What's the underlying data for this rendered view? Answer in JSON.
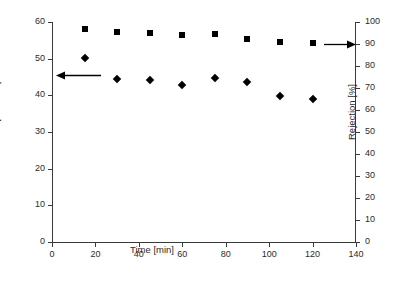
{
  "chart_data": {
    "type": "scatter",
    "title": "",
    "xlabel": "Time [min]",
    "ylabel": "Flux [L m-2 h-1]",
    "y2label": "Rejection [%]",
    "xlim": [
      0,
      140
    ],
    "ylim": [
      0,
      60
    ],
    "y2lim": [
      0,
      100
    ],
    "xticks": [
      0,
      20,
      40,
      60,
      80,
      100,
      120,
      140
    ],
    "yticks": [
      0,
      10,
      20,
      30,
      40,
      50,
      60
    ],
    "y2ticks": [
      0,
      10,
      20,
      30,
      40,
      50,
      60,
      70,
      80,
      90,
      100
    ],
    "grid": false,
    "legend": "none",
    "x": [
      15,
      30,
      45,
      60,
      75,
      90,
      105,
      120
    ],
    "series": [
      {
        "name": "Rejection",
        "marker": "square",
        "axis": "right",
        "color": "#000000",
        "values": [
          97.0,
          95.5,
          95.0,
          94.0,
          94.5,
          92.5,
          91.0,
          90.5
        ]
      },
      {
        "name": "Flux",
        "marker": "diamond",
        "axis": "left",
        "color": "#000000",
        "values": [
          50.3,
          44.5,
          44.1,
          42.7,
          44.6,
          43.7,
          39.8,
          38.9
        ]
      }
    ],
    "annotations": [
      {
        "name": "arrow-to-left-axis",
        "icon": "arrow-left-icon",
        "direction": "left"
      },
      {
        "name": "arrow-to-right-axis",
        "icon": "arrow-right-icon",
        "direction": "right"
      }
    ]
  },
  "axes": {
    "x": {
      "title": "Time [min]",
      "tick_labels": [
        "0",
        "20",
        "40",
        "60",
        "80",
        "100",
        "120",
        "140"
      ]
    },
    "y_left": {
      "title_prefix": "Flux [L m",
      "title_sup1": "-2",
      "title_mid": " h",
      "title_sup2": "-1",
      "title_suffix": "]",
      "tick_labels": [
        "0",
        "10",
        "20",
        "30",
        "40",
        "50",
        "60"
      ]
    },
    "y_right": {
      "title": "Rejection [%]",
      "tick_labels": [
        "0",
        "10",
        "20",
        "30",
        "40",
        "50",
        "60",
        "70",
        "80",
        "90",
        "100"
      ]
    }
  },
  "colors": {
    "axis": "#3a3a3a",
    "marker": "#000000",
    "text": "#2b2b2b",
    "background": "#ffffff"
  }
}
